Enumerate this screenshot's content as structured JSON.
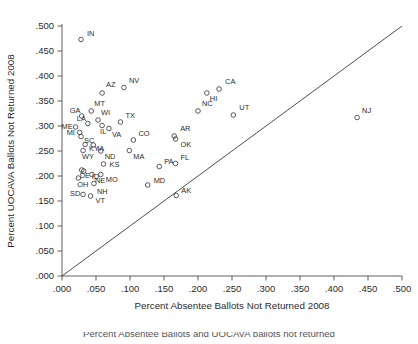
{
  "figure": {
    "xlabel": "Percent Absentee Ballots Not Returned 2008",
    "ylabel": "Percent UOCAVA Ballots Not Returned 2008",
    "caption_partial": "Percent Absentee Ballots and UOCAVA ballots not returned"
  },
  "chart_data": {
    "type": "scatter",
    "title": "",
    "xlabel": "Percent Absentee Ballots Not Returned 2008",
    "ylabel": "Percent UOCAVA Ballots Not Returned 2008",
    "xlim": [
      0.0,
      0.5
    ],
    "ylim": [
      0.0,
      0.5
    ],
    "xticks": [
      0.0,
      0.05,
      0.1,
      0.15,
      0.2,
      0.25,
      0.3,
      0.35,
      0.4,
      0.45,
      0.5
    ],
    "yticks": [
      0.0,
      0.05,
      0.1,
      0.15,
      0.2,
      0.25,
      0.3,
      0.35,
      0.4,
      0.45,
      0.5
    ],
    "xtick_labels": [
      ".000",
      ".050",
      ".100",
      ".150",
      ".200",
      ".250",
      ".300",
      ".350",
      ".400",
      ".450",
      ".500"
    ],
    "ytick_labels": [
      ".000",
      ".050",
      ".100",
      ".150",
      ".200",
      ".250",
      ".300",
      ".350",
      ".400",
      ".450",
      ".500"
    ],
    "grid": false,
    "legend": null,
    "reference_line": {
      "type": "identity",
      "from": [
        0.0,
        0.0
      ],
      "to": [
        0.5,
        0.5
      ],
      "label": "45-degree line"
    },
    "marker_style": "open-circle",
    "points": [
      {
        "label": "IN",
        "x": 0.028,
        "y": 0.473,
        "lx": 6,
        "ly": -4
      },
      {
        "label": "NV",
        "x": 0.091,
        "y": 0.377,
        "lx": 5,
        "ly": -5
      },
      {
        "label": "AZ",
        "x": 0.059,
        "y": 0.366,
        "lx": 4,
        "ly": -6
      },
      {
        "label": "CA",
        "x": 0.231,
        "y": 0.374,
        "lx": 6,
        "ly": -5
      },
      {
        "label": "HI",
        "x": 0.213,
        "y": 0.366,
        "lx": 3,
        "ly": 8
      },
      {
        "label": "NC",
        "x": 0.2,
        "y": 0.33,
        "lx": 4,
        "ly": -5
      },
      {
        "label": "UT",
        "x": 0.252,
        "y": 0.322,
        "lx": 6,
        "ly": -5
      },
      {
        "label": "NJ",
        "x": 0.434,
        "y": 0.317,
        "lx": 5,
        "ly": -5
      },
      {
        "label": "MT",
        "x": 0.043,
        "y": 0.33,
        "lx": 3,
        "ly": -5
      },
      {
        "label": "GA",
        "x": 0.029,
        "y": 0.32,
        "lx": -12,
        "ly": -3
      },
      {
        "label": "WI",
        "x": 0.053,
        "y": 0.312,
        "lx": 3,
        "ly": -5
      },
      {
        "label": "TX",
        "x": 0.086,
        "y": 0.308,
        "lx": 5,
        "ly": -4
      },
      {
        "label": "LA",
        "x": 0.038,
        "y": 0.305,
        "lx": -11,
        "ly": -3
      },
      {
        "label": "IL",
        "x": 0.059,
        "y": 0.301,
        "lx": -2,
        "ly": 8
      },
      {
        "label": "VA",
        "x": 0.069,
        "y": 0.295,
        "lx": 3,
        "ly": 8
      },
      {
        "label": "ME",
        "x": 0.02,
        "y": 0.298,
        "lx": -14,
        "ly": 2
      },
      {
        "label": "MI",
        "x": 0.026,
        "y": 0.287,
        "lx": -13,
        "ly": 2
      },
      {
        "label": "SC",
        "x": 0.028,
        "y": 0.279,
        "lx": 3,
        "ly": 6
      },
      {
        "label": "AR",
        "x": 0.165,
        "y": 0.28,
        "lx": 6,
        "ly": -5
      },
      {
        "label": "OK",
        "x": 0.167,
        "y": 0.274,
        "lx": 5,
        "ly": 8
      },
      {
        "label": "CO",
        "x": 0.105,
        "y": 0.272,
        "lx": 5,
        "ly": -4
      },
      {
        "label": "KY",
        "x": 0.034,
        "y": 0.263,
        "lx": 4,
        "ly": 6
      },
      {
        "label": "IA",
        "x": 0.046,
        "y": 0.262,
        "lx": 4,
        "ly": 6
      },
      {
        "label": "WY",
        "x": 0.031,
        "y": 0.251,
        "lx": -1,
        "ly": 8
      },
      {
        "label": "ND",
        "x": 0.057,
        "y": 0.25,
        "lx": 4,
        "ly": 8
      },
      {
        "label": "MA",
        "x": 0.099,
        "y": 0.251,
        "lx": 4,
        "ly": 8
      },
      {
        "label": "KS",
        "x": 0.061,
        "y": 0.224,
        "lx": 6,
        "ly": 3
      },
      {
        "label": "PA",
        "x": 0.143,
        "y": 0.219,
        "lx": 5,
        "ly": -3
      },
      {
        "label": "FL",
        "x": 0.167,
        "y": 0.225,
        "lx": 5,
        "ly": -4
      },
      {
        "label": "DE",
        "x": 0.029,
        "y": 0.212,
        "lx": -2,
        "ly": 8
      },
      {
        "label": "ID",
        "x": 0.032,
        "y": 0.21,
        "lx": 8,
        "ly": 8
      },
      {
        "label": "NE",
        "x": 0.044,
        "y": 0.203,
        "lx": 3,
        "ly": 8
      },
      {
        "label": "MO",
        "x": 0.057,
        "y": 0.203,
        "lx": 5,
        "ly": 7
      },
      {
        "label": "OH",
        "x": 0.024,
        "y": 0.196,
        "lx": -1,
        "ly": 9
      },
      {
        "label": "MD",
        "x": 0.126,
        "y": 0.182,
        "lx": 6,
        "ly": -2
      },
      {
        "label": "NH",
        "x": 0.047,
        "y": 0.185,
        "lx": 3,
        "ly": 10
      },
      {
        "label": "SD",
        "x": 0.031,
        "y": 0.163,
        "lx": -13,
        "ly": 1
      },
      {
        "label": "VT",
        "x": 0.042,
        "y": 0.16,
        "lx": 5,
        "ly": 7
      },
      {
        "label": "AK",
        "x": 0.168,
        "y": 0.161,
        "lx": 5,
        "ly": -3
      }
    ]
  }
}
